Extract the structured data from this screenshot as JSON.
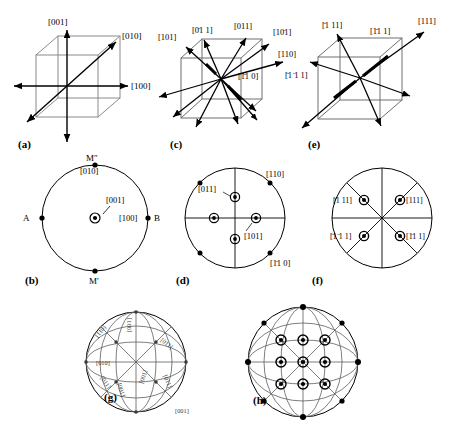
{
  "figure": {
    "line_color": "#000000",
    "cell_color": "#808080",
    "background": "#ffffff"
  },
  "panels": [
    {
      "id": "a",
      "caption": "(a)",
      "type": "cube-directions",
      "description": "Cubic unit cell with <100> axes and one body diagonal drawn",
      "labels": [
        "[001]",
        "[010]",
        "[100]"
      ]
    },
    {
      "id": "b",
      "caption": "(b)",
      "type": "stereographic-projection",
      "description": "Standard (001) stereographic projection showing <100> poles",
      "center_pole": "[001]",
      "rim_labels": [
        "M″",
        "[010]",
        "A",
        "[100]",
        "B",
        "M′"
      ],
      "poles": [
        {
          "label": "[001]",
          "x": 0,
          "y": 0,
          "marker": "open-circle-dot"
        },
        {
          "label": "[010]",
          "x": 0,
          "y": -1,
          "marker": "filled-dot"
        },
        {
          "label": "[100]",
          "x": 1,
          "y": 0,
          "marker": "filled-dot"
        },
        {
          "label": "A",
          "x": -1,
          "y": 0,
          "marker": "filled-dot"
        },
        {
          "label": "M′",
          "x": 0,
          "y": 1,
          "marker": "filled-dot"
        }
      ]
    },
    {
      "id": "c",
      "caption": "(c)",
      "type": "cube-directions",
      "description": "Cubic unit cell with the six <110> face-diagonal directions drawn",
      "labels": [
        "[101]",
        "[0̈1̈ 1]",
        "[011]",
        "[10̈1]",
        "[110]",
        "[1̈1̈0]"
      ],
      "labels_plain": [
        "[101]",
        "[0T1]",
        "[011]",
        "[101]",
        "[110]",
        "[1T0]"
      ]
    },
    {
      "id": "d",
      "caption": "(d)",
      "type": "stereographic-projection",
      "description": "Stereographic projection of the <110> poles",
      "rim_labels": [
        "[110]",
        "[1̈1̈0]"
      ],
      "inner_labels": [
        "[011]",
        "[101]"
      ],
      "poles": [
        {
          "label": "[011]",
          "x": 0,
          "y": -0.42,
          "marker": "open-circle-dot"
        },
        {
          "label": "[101]",
          "x": 0.42,
          "y": 0,
          "marker": "open-circle-dot"
        },
        {
          "label": "",
          "x": -0.42,
          "y": 0,
          "marker": "open-circle-dot"
        },
        {
          "label": "",
          "x": 0,
          "y": 0.42,
          "marker": "open-circle-dot"
        },
        {
          "label": "[110]",
          "x": 0.707,
          "y": -0.707,
          "marker": "filled-dot"
        },
        {
          "label": "",
          "x": -0.707,
          "y": -0.707,
          "marker": "filled-dot"
        },
        {
          "label": "",
          "x": -0.707,
          "y": 0.707,
          "marker": "filled-dot"
        },
        {
          "label": "[1̈1̈0]",
          "x": 0.707,
          "y": 0.707,
          "marker": "filled-dot"
        }
      ]
    },
    {
      "id": "e",
      "caption": "(e)",
      "type": "cube-directions",
      "description": "Cubic unit cell with the four <111> body-diagonal directions drawn",
      "labels": [
        "[̈1̈11]",
        "[1̈1̈1]",
        "[111]",
        "[̈1̈1̈11]"
      ],
      "labels_plain": [
        "[T11]",
        "[1T1]",
        "[111]",
        "[TT1]"
      ]
    },
    {
      "id": "f",
      "caption": "(f)",
      "type": "stereographic-projection",
      "description": "Stereographic projection of the four <111> poles",
      "poles": [
        {
          "label": "[̈1̈11]",
          "x": -0.366,
          "y": -0.366,
          "marker": "open-circle-dot"
        },
        {
          "label": "[111]",
          "x": 0.366,
          "y": -0.366,
          "marker": "open-circle-dot"
        },
        {
          "label": "[̈1̈1̈11]",
          "x": -0.366,
          "y": 0.366,
          "marker": "open-circle-dot"
        },
        {
          "label": "[1̈1̈1]",
          "x": 0.366,
          "y": 0.366,
          "marker": "open-circle-dot"
        }
      ],
      "label_texts": [
        "[̈1̈11]",
        "[111]",
        "[̈1̈1̈11]",
        "[1̈1̈1]"
      ]
    },
    {
      "id": "g",
      "caption": "(g)",
      "type": "stereographic-net",
      "description": "Standard stereographic projection net with great circles and indexed zones",
      "labels": [
        "[110]",
        "[001]",
        "[011]",
        "[010]",
        "[011]",
        "[011]",
        "[001]",
        "[001]",
        "[001]"
      ],
      "rotated_labels": [
        "[110]",
        "[001]",
        "[011]",
        "[010]",
        "[011]",
        "[011]",
        "[001]",
        "[001]",
        "[001]"
      ]
    },
    {
      "id": "h",
      "caption": "(h)",
      "type": "stereographic-projection",
      "description": "Combined stereogram: all <100>, <110> and <111> poles on the great-circle net",
      "pole_count": 21
    }
  ],
  "captions": {
    "a": "(a)",
    "b": "(b)",
    "c": "(c)",
    "d": "(d)",
    "e": "(e)",
    "f": "(f)",
    "g": "(g)",
    "h": "(h)"
  },
  "direction_labels": {
    "d001": "[001]",
    "d010": "[010]",
    "d100": "[100]",
    "d101": "[101]",
    "d0b11": "[0̈1 1]",
    "d011": "[011]",
    "d10b1": "[10̈1]",
    "d110": "[110]",
    "d1b10": "[1̈1 0]",
    "db111": "[̈1 11]",
    "d1b11": "[1̈1 1]",
    "d111": "[111]",
    "db1b11": "[̈1 ̈1 1]",
    "dMsecond": "M″",
    "dMprime": "M′",
    "A": "A",
    "B": "B"
  }
}
